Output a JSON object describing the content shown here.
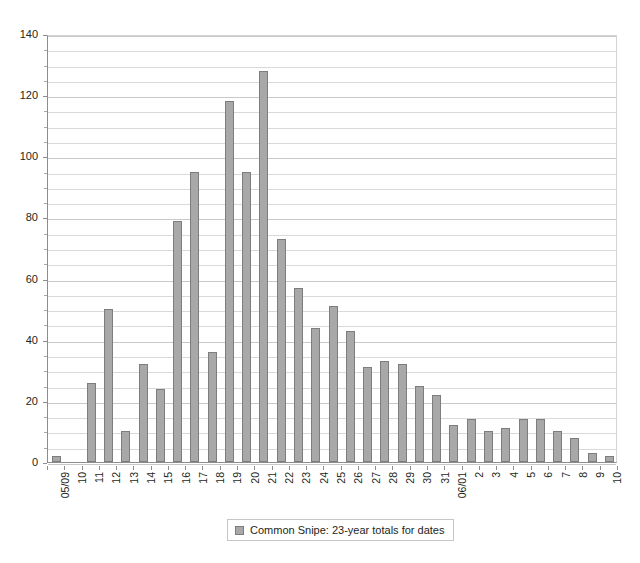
{
  "chart_data": {
    "type": "bar",
    "title": "",
    "xlabel": "",
    "ylabel": "",
    "ylim": [
      0,
      140
    ],
    "y_major_step": 20,
    "y_minor_step": 5,
    "grid": true,
    "legend_position": "bottom",
    "series_name": "Common Snipe: 23-year totals for dates",
    "categories": [
      "05/09",
      "10",
      "11",
      "12",
      "13",
      "14",
      "15",
      "16",
      "17",
      "18",
      "19",
      "20",
      "21",
      "22",
      "23",
      "24",
      "25",
      "26",
      "27",
      "28",
      "29",
      "30",
      "31",
      "06/01",
      "2",
      "3",
      "4",
      "5",
      "6",
      "7",
      "8",
      "9",
      "10"
    ],
    "values": [
      2,
      0,
      26,
      50,
      10,
      32,
      24,
      79,
      95,
      36,
      118,
      95,
      128,
      73,
      57,
      44,
      51,
      43,
      31,
      33,
      32,
      25,
      22,
      12,
      14,
      10,
      11,
      14,
      14,
      10,
      8,
      3,
      2
    ],
    "y_tick_labels": [
      "0",
      "20",
      "40",
      "60",
      "80",
      "100",
      "120",
      "140"
    ],
    "y_tick_values": [
      0,
      20,
      40,
      60,
      80,
      100,
      120,
      140
    ],
    "bar_color": "#a8a8a8",
    "bar_border_color": "#7d7d7d",
    "gridline_color": "#d9d9d9",
    "axis_color": "#8d8d8d",
    "text_color": "#231f20",
    "background": "#ffffff"
  },
  "legend": {
    "entries": [
      {
        "label": "Common Snipe: 23-year totals for dates",
        "color": "#a8a8a8"
      }
    ]
  }
}
